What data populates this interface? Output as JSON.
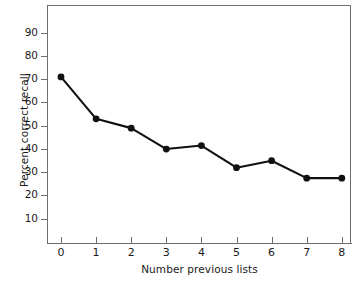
{
  "chart_data": {
    "type": "line",
    "title": "",
    "xlabel": "Number previous lists",
    "ylabel": "Percent correct recall",
    "x": [
      0,
      1,
      2,
      3,
      4,
      5,
      6,
      7,
      8
    ],
    "values": [
      71,
      53,
      49,
      40,
      41.5,
      32,
      35,
      27.5,
      27.5
    ],
    "categories": [
      "0",
      "1",
      "2",
      "3",
      "4",
      "5",
      "6",
      "7",
      "8"
    ],
    "series": [
      {
        "name": "Percent correct recall",
        "values": [
          71,
          53,
          49,
          40,
          41.5,
          32,
          35,
          27.5,
          27.5
        ]
      }
    ],
    "xlim": [
      0,
      8
    ],
    "ylim": [
      0,
      100
    ],
    "xticks": [
      "0",
      "1",
      "2",
      "3",
      "4",
      "5",
      "6",
      "7",
      "8"
    ],
    "yticks": [
      "10",
      "20",
      "30",
      "40",
      "50",
      "60",
      "70",
      "80",
      "90"
    ],
    "ytick_values": [
      10,
      20,
      30,
      40,
      50,
      60,
      70,
      80,
      90
    ],
    "grid": false,
    "legend": false,
    "legend_position": "none",
    "marker": "filled-circle",
    "line_color": "#111111",
    "marker_color": "#111111",
    "axis_color": "#6e6e6e",
    "background": "#ffffff"
  },
  "figure": {
    "top_sliver_text": ""
  }
}
